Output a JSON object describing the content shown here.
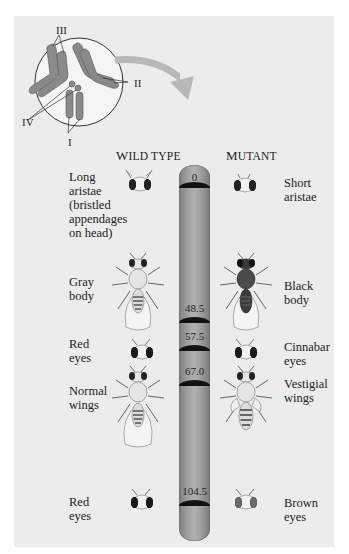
{
  "inset": {
    "chromosome_labels": [
      "I",
      "II",
      "III",
      "IV"
    ]
  },
  "headers": {
    "wild_type": {
      "first": "W",
      "rest": "ILD TYPE"
    },
    "mutant": {
      "first": "M",
      "rest": "UTANT"
    }
  },
  "chromosome": {
    "color": "#9e9e9e",
    "band_color": "#111111",
    "loci": [
      {
        "position": "0",
        "wild": [
          "Long",
          "aristae",
          "(bristled",
          "appendages",
          "on head)"
        ],
        "mutant": [
          "Short",
          "aristae"
        ],
        "wild_icon": "fly-head-long-aristae-icon",
        "mutant_icon": "fly-head-short-aristae-icon"
      },
      {
        "position": "48.5",
        "wild": [
          "Gray",
          "body"
        ],
        "mutant": [
          "Black",
          "body"
        ],
        "wild_icon": "fly-gray-body-icon",
        "mutant_icon": "fly-black-body-icon"
      },
      {
        "position": "57.5",
        "wild": [
          "Red",
          "eyes"
        ],
        "mutant": [
          "Cinnabar",
          "eyes"
        ],
        "wild_icon": "fly-head-red-eyes-icon",
        "mutant_icon": "fly-head-cinnabar-eyes-icon"
      },
      {
        "position": "67.0",
        "wild": [
          "Normal",
          "wings"
        ],
        "mutant": [
          "Vestigial",
          "wings"
        ],
        "wild_icon": "fly-normal-wings-icon",
        "mutant_icon": "fly-vestigial-wings-icon"
      },
      {
        "position": "104.5",
        "wild": [
          "Red",
          "eyes"
        ],
        "mutant": [
          "Brown",
          "eyes"
        ],
        "wild_icon": "fly-head-red-eyes-icon",
        "mutant_icon": "fly-head-brown-eyes-icon"
      }
    ]
  }
}
